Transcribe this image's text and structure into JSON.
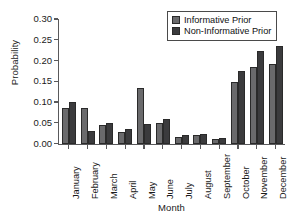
{
  "chart_data": {
    "type": "bar",
    "title": "",
    "xlabel": "Month",
    "ylabel": "Probability",
    "categories": [
      "January",
      "February",
      "March",
      "April",
      "May",
      "June",
      "July",
      "August",
      "September",
      "October",
      "November",
      "December"
    ],
    "series": [
      {
        "name": "Informative Prior",
        "color": "#6a6a6c",
        "values": [
          0.085,
          0.085,
          0.045,
          0.029,
          0.134,
          0.049,
          0.017,
          0.02,
          0.011,
          0.149,
          0.185,
          0.191
        ]
      },
      {
        "name": "Non-Informative Prior",
        "color": "#3b3b3d",
        "values": [
          0.1,
          0.03,
          0.05,
          0.035,
          0.048,
          0.06,
          0.02,
          0.022,
          0.014,
          0.175,
          0.224,
          0.236
        ]
      }
    ],
    "ylim": [
      0.0,
      0.3
    ],
    "yticks": [
      "0.00",
      "0.05",
      "0.10",
      "0.15",
      "0.20",
      "0.25",
      "0.30"
    ],
    "ytick_values": [
      0.0,
      0.05,
      0.1,
      0.15,
      0.2,
      0.25,
      0.3
    ],
    "grid": false,
    "legend_position": "top-right",
    "legend": [
      "Informative Prior",
      "Non-Informative Prior"
    ],
    "axis_color": "#59595b"
  }
}
